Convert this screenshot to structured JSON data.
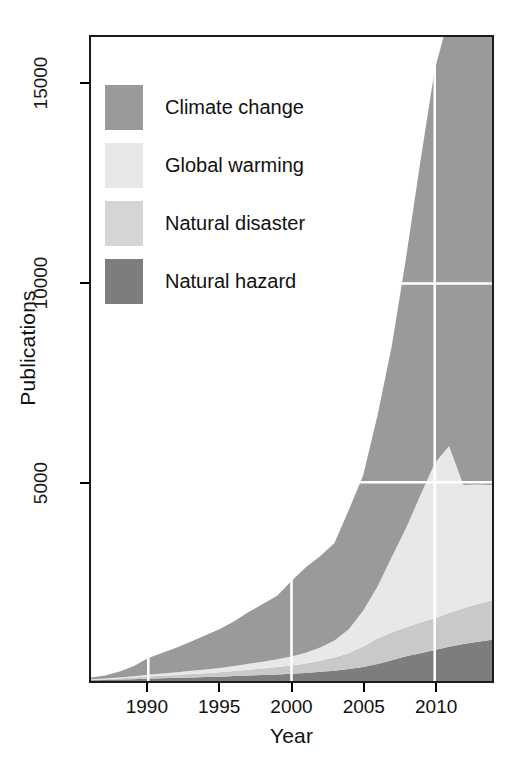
{
  "chart_data": {
    "type": "area",
    "title": "",
    "xlabel": "Year",
    "ylabel": "Publications",
    "xlim": [
      1986,
      2014
    ],
    "ylim": [
      0,
      16200
    ],
    "xticks": [
      1990,
      1995,
      2000,
      2005,
      2010
    ],
    "yticks": [
      5000,
      10000,
      15000
    ],
    "xtick_labels": [
      "1990",
      "1995",
      "2000",
      "2005",
      "2010"
    ],
    "ytick_labels": [
      "5000",
      "10000",
      "15000"
    ],
    "grid": "white gridlines at y=5000, y=10000 and x=1990, x=2000, x=2010",
    "legend_position": "top-left inside plot",
    "stacked": true,
    "x": [
      1986,
      1987,
      1988,
      1989,
      1990,
      1991,
      1992,
      1993,
      1994,
      1995,
      1996,
      1997,
      1998,
      1999,
      2000,
      2001,
      2002,
      2003,
      2004,
      2005,
      2006,
      2007,
      2008,
      2009,
      2010,
      2011,
      2012,
      2013,
      2014
    ],
    "series": [
      {
        "name": "Natural hazard",
        "color": "#7d7d7d",
        "values": [
          20,
          25,
          35,
          45,
          60,
          70,
          80,
          90,
          100,
          110,
          125,
          140,
          150,
          165,
          180,
          200,
          230,
          260,
          300,
          350,
          430,
          520,
          620,
          700,
          780,
          860,
          930,
          990,
          1040
        ]
      },
      {
        "name": "Natural disaster",
        "color": "#c9c9c9",
        "values": [
          15,
          20,
          30,
          40,
          55,
          65,
          75,
          85,
          95,
          110,
          125,
          145,
          165,
          185,
          210,
          240,
          280,
          330,
          400,
          520,
          640,
          700,
          730,
          770,
          800,
          850,
          900,
          950,
          990
        ]
      },
      {
        "name": "Global warming",
        "color": "#e8e8e8",
        "values": [
          10,
          15,
          25,
          35,
          45,
          55,
          65,
          80,
          95,
          110,
          130,
          150,
          170,
          195,
          225,
          270,
          330,
          430,
          600,
          900,
          1300,
          1900,
          2500,
          3200,
          3900,
          4200,
          3100,
          3000,
          2900
        ]
      },
      {
        "name": "Climate change",
        "color": "#9a9a9a",
        "values": [
          40,
          80,
          150,
          260,
          420,
          520,
          620,
          740,
          860,
          980,
          1120,
          1300,
          1450,
          1600,
          1900,
          2150,
          2300,
          2450,
          3000,
          3400,
          4300,
          5300,
          6800,
          8400,
          9900,
          10800,
          11600,
          12300,
          13100
        ]
      }
    ],
    "legend": [
      {
        "label": "Climate change",
        "color": "#9a9a9a"
      },
      {
        "label": "Global warming",
        "color": "#e8e8e8"
      },
      {
        "label": "Natural disaster",
        "color": "#d5d5d5"
      },
      {
        "label": "Natural hazard",
        "color": "#7d7d7d"
      }
    ]
  }
}
